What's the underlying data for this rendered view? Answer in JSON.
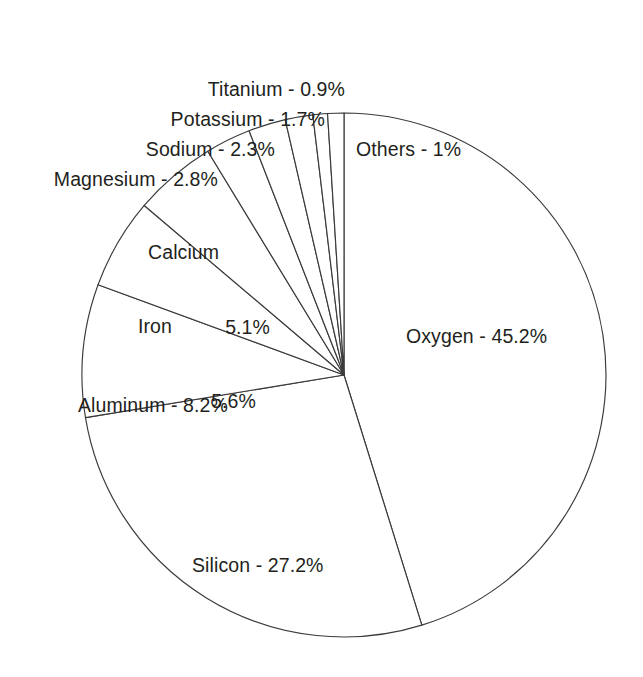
{
  "chart_data": {
    "type": "pie",
    "title": "",
    "subtitle": "",
    "xlabel": "",
    "ylabel": "",
    "legend": "none",
    "grid": false,
    "unit": "%",
    "start_angle_deg": 0,
    "direction": "clockwise",
    "categories": [
      "Oxygen",
      "Silicon",
      "Aluminum",
      "Iron",
      "Calcium",
      "Magnesium",
      "Sodium",
      "Potassium",
      "Titanium",
      "Others"
    ],
    "values": [
      45.2,
      27.2,
      8.2,
      5.6,
      5.1,
      2.8,
      2.3,
      1.7,
      0.9,
      1
    ],
    "slices": [
      {
        "name": "Oxygen",
        "value": 45.2,
        "label": "Oxygen - 45.2%",
        "percent_text": "45.2%",
        "placement": "inside"
      },
      {
        "name": "Silicon",
        "value": 27.2,
        "label": "Silicon - 27.2%",
        "percent_text": "27.2%",
        "placement": "inside"
      },
      {
        "name": "Aluminum",
        "value": 8.2,
        "label": "Aluminum - 8.2%",
        "percent_text": "8.2%",
        "placement": "inside"
      },
      {
        "name": "Iron",
        "value": 5.6,
        "label": "Iron 5.6%",
        "percent_text": "5.6%",
        "placement": "inside"
      },
      {
        "name": "Calcium",
        "value": 5.1,
        "label": "Calcium 5.1%",
        "percent_text": "5.1%",
        "placement": "inside"
      },
      {
        "name": "Magnesium",
        "value": 2.8,
        "label": "Magnesium - 2.8%",
        "percent_text": "2.8%",
        "placement": "outside"
      },
      {
        "name": "Sodium",
        "value": 2.3,
        "label": "Sodium - 2.3%",
        "percent_text": "2.3%",
        "placement": "outside"
      },
      {
        "name": "Potassium",
        "value": 1.7,
        "label": "Potassium - 1.7%",
        "percent_text": "1.7%",
        "placement": "outside"
      },
      {
        "name": "Titanium",
        "value": 0.9,
        "label": "Titanium - 0.9%",
        "percent_text": "0.9%",
        "placement": "outside"
      },
      {
        "name": "Others",
        "value": 1,
        "label": "Others - 1%",
        "percent_text": "1%",
        "placement": "outside"
      }
    ],
    "colors": {
      "background": "#ffffff",
      "slice_fill": "#ffffff",
      "slice_stroke": "#3a3a3c",
      "text": "#231f20"
    }
  },
  "labels": {
    "titanium": "Titanium - 0.9%",
    "potassium": "Potassium - 1.7%",
    "sodium": "Sodium - 2.3%",
    "magnesium": "Magnesium - 2.8%",
    "others": "Others - 1%",
    "calcium_name": "Calcium",
    "calcium_value": "5.1%",
    "iron_name": "Iron",
    "iron_value": "5.6%",
    "aluminum": "Aluminum - 8.2%",
    "oxygen": "Oxygen - 45.2%",
    "silicon": "Silicon - 27.2%"
  }
}
